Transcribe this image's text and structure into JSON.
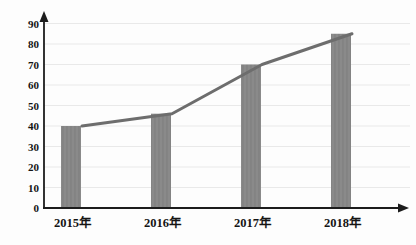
{
  "chart_data": {
    "type": "bar",
    "subtype": "bar-with-line-overlay",
    "title": "",
    "xlabel": "",
    "ylabel": "",
    "categories": [
      "2015年",
      "2016年",
      "2017年",
      "2018年"
    ],
    "series": [
      {
        "name": "bars",
        "type": "bar",
        "values": [
          40,
          46,
          70,
          85
        ]
      },
      {
        "name": "trend-line",
        "type": "line",
        "values": [
          40,
          46,
          70,
          85
        ]
      }
    ],
    "ylim": [
      0,
      90
    ],
    "yticks": [
      0,
      10,
      20,
      30,
      40,
      50,
      60,
      70,
      80,
      90
    ],
    "grid": "horizontal-faint",
    "legend": "none",
    "axis_arrows": true,
    "line_note": "trend line overlays bar tops, vertices offset to right edge of each bar",
    "colors": {
      "background": "#fdfdfd",
      "bar_fill": "#8a8a8a",
      "bar_stripe": "#7e7e7e",
      "line": "#6d6d6d",
      "axis": "#1c1c1c",
      "gridline": "#e9e9e9",
      "text": "#151515"
    }
  }
}
